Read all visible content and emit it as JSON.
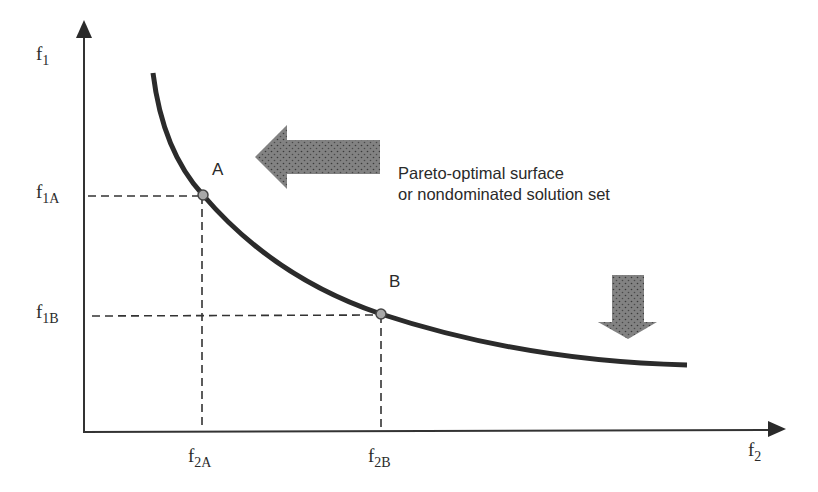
{
  "diagram": {
    "type": "pareto-front",
    "axes": {
      "y_label": {
        "main": "f",
        "sub": "1"
      },
      "x_label": {
        "main": "f",
        "sub": "2"
      }
    },
    "points": [
      {
        "id": "A",
        "label": "A",
        "y_tick": {
          "main": "f",
          "sub": "1A"
        },
        "x_tick": {
          "main": "f",
          "sub": "2A"
        }
      },
      {
        "id": "B",
        "label": "B",
        "y_tick": {
          "main": "f",
          "sub": "1B"
        },
        "x_tick": {
          "main": "f",
          "sub": "2B"
        }
      }
    ],
    "annotation": {
      "line1": "Pareto-optimal surface",
      "line2": "or nondominated solution set"
    },
    "arrows": [
      {
        "name": "improve-f2-arrow",
        "direction": "left"
      },
      {
        "name": "improve-f1-arrow",
        "direction": "down"
      }
    ],
    "colors": {
      "curve": "#2b2b2b",
      "axis": "#333333",
      "arrow_fill": "#7a7a7a",
      "point_fill": "#a8a8a8"
    }
  }
}
